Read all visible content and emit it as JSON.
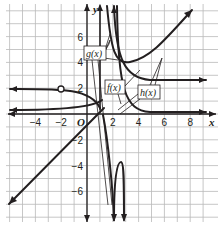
{
  "chart_data": {
    "type": "line",
    "title": "",
    "xlabel": "x",
    "ylabel": "y",
    "xlim": [
      -6.5,
      9.5
    ],
    "ylim": [
      -8,
      8.5
    ],
    "grid": true,
    "x_ticks": [
      "-4",
      "-2",
      "O",
      "2",
      "4",
      "6",
      "8"
    ],
    "y_ticks": [
      "6",
      "4",
      "2",
      "-2",
      "-4",
      "-6"
    ],
    "series": [
      {
        "name": "g(x)",
        "label": "g(x)",
        "description": "rational function with vertical asymptote near x = 1, horizontal asymptote y = 0 to the right; left branch levels toward y = 2 with an open hole at (-2, 2)",
        "hole": [
          -2,
          2
        ]
      },
      {
        "name": "f(x)",
        "label": "f(x)",
        "description": "rational function with vertical asymptotes near x = 1 and x = 2.5, left branch approaches y = 0 from above, middle branch dips downward to -infinity"
      },
      {
        "name": "h(x)",
        "label": "h(x)",
        "description": "rational function with slant asymptote; lower-left branch is a line from (-6.5,-7.5) rising to near (1.5,0.5), upper-right branch rises from (2.5,4) to (8,7.5)"
      }
    ],
    "labels": [
      "g(x)",
      "f(x)",
      "h(x)"
    ]
  },
  "axes": {
    "x_label": "x",
    "y_label": "y"
  },
  "ticks": {
    "x": [
      {
        "v": -4,
        "t": "−4"
      },
      {
        "v": -2,
        "t": "−2"
      },
      {
        "v": 2,
        "t": "2"
      },
      {
        "v": 4,
        "t": "4"
      },
      {
        "v": 6,
        "t": "6"
      },
      {
        "v": 8,
        "t": "8"
      }
    ],
    "y": [
      {
        "v": 6,
        "t": "6"
      },
      {
        "v": 4,
        "t": "4"
      },
      {
        "v": 2,
        "t": "2"
      },
      {
        "v": -2,
        "t": "−2"
      },
      {
        "v": -4,
        "t": "−4"
      },
      {
        "v": -6,
        "t": "−6"
      }
    ],
    "origin": "O"
  },
  "callouts": {
    "g": "g(x)",
    "f": "f(x)",
    "h": "h(x)"
  }
}
